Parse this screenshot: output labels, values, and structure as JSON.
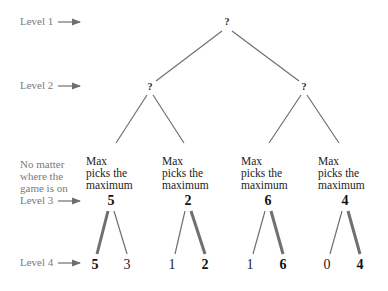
{
  "levels": [
    {
      "label": "Level 1"
    },
    {
      "label": "Level 2"
    },
    {
      "label": "Level 3"
    },
    {
      "label": "Level 4"
    }
  ],
  "note": [
    "No matter",
    "where the",
    "game is on"
  ],
  "level1": {
    "node": "?"
  },
  "level2": {
    "nodes": [
      "?",
      "?"
    ]
  },
  "level3": {
    "caption": [
      "Max",
      "picks the",
      "maximum"
    ],
    "values": [
      "5",
      "2",
      "6",
      "4"
    ]
  },
  "level4": {
    "values": [
      "5",
      "3",
      "1",
      "2",
      "1",
      "6",
      "0",
      "4"
    ],
    "chosen": [
      true,
      false,
      false,
      true,
      false,
      true,
      false,
      true
    ]
  },
  "colors": {
    "edge": "#707070",
    "label": "#7a7a7a",
    "text": "#222222"
  }
}
